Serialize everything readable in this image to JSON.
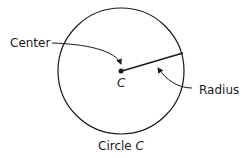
{
  "labels": {
    "center": "Center",
    "point": "C",
    "radius": "Radius",
    "caption_prefix": "Circle ",
    "caption_var": "C"
  },
  "colors": {
    "stroke": "#1a1a1a",
    "background": "#ffffff"
  }
}
